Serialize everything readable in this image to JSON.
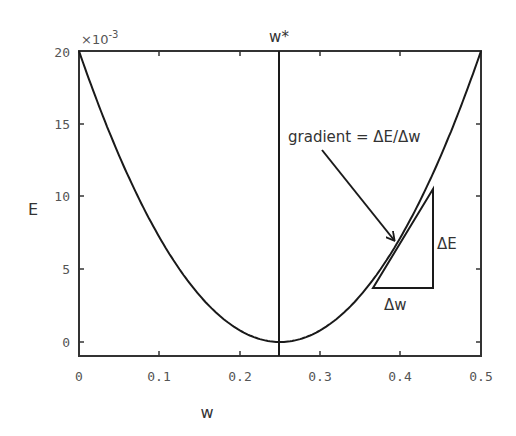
{
  "chart_data": {
    "type": "line",
    "title": "",
    "xlabel": "w",
    "ylabel": "E",
    "y_multiplier": "×10",
    "y_multiplier_exponent": "-3",
    "xlim": [
      0,
      0.5
    ],
    "ylim": [
      -1,
      20
    ],
    "x_ticks": [
      "0",
      "0.1",
      "0.2",
      "0.3",
      "0.4",
      "0.5"
    ],
    "y_ticks": [
      "0",
      "5",
      "10",
      "15",
      "20"
    ],
    "grid": false,
    "series": [
      {
        "name": "E(w)",
        "formula": "E = 0.32 * (w - 0.25)^2",
        "x": [
          0,
          0.05,
          0.1,
          0.15,
          0.2,
          0.25,
          0.3,
          0.35,
          0.4,
          0.45,
          0.5
        ],
        "y_e3": [
          20,
          12.8,
          7.2,
          3.2,
          0.8,
          0,
          0.8,
          3.2,
          7.2,
          12.8,
          20
        ]
      }
    ],
    "annotations": {
      "optimum_line": {
        "x": 0.25,
        "label": "w*"
      },
      "gradient_label": "gradient = ΔE/Δw",
      "delta_e_label": "ΔE",
      "delta_w_label": "Δw",
      "tangent_point": {
        "w": 0.39,
        "E_e3": 6.3
      },
      "triangle": {
        "w_start": 0.365,
        "w_end": 0.44,
        "E_bottom_e3": 3.7,
        "E_top_e3": 10.5
      }
    }
  }
}
